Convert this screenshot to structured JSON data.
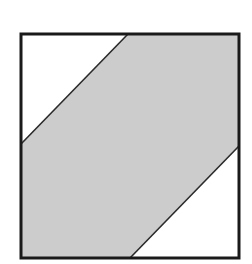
{
  "diagram": {
    "colors": {
      "background": "#ffffff",
      "band_fill": "#cccccc",
      "outline": "#1a1a1a",
      "diagonal_lines": "#2a2a2a"
    },
    "square": {
      "x": 21,
      "y": 34,
      "width": 218,
      "height": 224
    },
    "band": {
      "points": [
        [
          128,
          34
        ],
        [
          239,
          34
        ],
        [
          239,
          146
        ],
        [
          130,
          258
        ],
        [
          21,
          258
        ],
        [
          21,
          144
        ]
      ]
    },
    "upper_line": {
      "x1": 128,
      "y1": 34,
      "x2": 21,
      "y2": 144
    },
    "lower_line": {
      "x1": 239,
      "y1": 146,
      "x2": 130,
      "y2": 258
    }
  }
}
